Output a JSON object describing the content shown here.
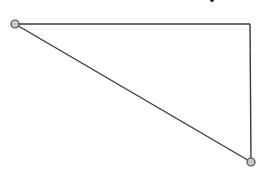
{
  "diagram": {
    "type": "right-triangle",
    "stroke_color": "#3a3a3a",
    "node_fill": "#c8c8c8",
    "node_stroke": "#4a4a4a",
    "vertices": {
      "left": {
        "x": 15,
        "y": 24,
        "marked": true
      },
      "top_right": {
        "x": 250,
        "y": 24,
        "marked": false
      },
      "bottom_right": {
        "x": 251,
        "y": 162,
        "marked": true
      }
    },
    "edges": [
      {
        "from": "left",
        "to": "top_right"
      },
      {
        "from": "top_right",
        "to": "bottom_right"
      },
      {
        "from": "left",
        "to": "bottom_right"
      }
    ]
  }
}
